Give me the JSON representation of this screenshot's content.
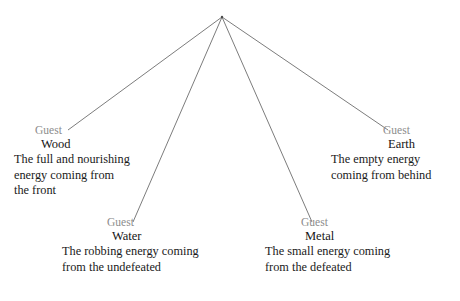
{
  "diagram": {
    "type": "radial-tree",
    "root": {
      "x": 222,
      "y": 17
    },
    "edge_color": "#5a5a5a",
    "guest_color": "#8c8c8c",
    "text_color": "#1a1a1a",
    "nodes": [
      {
        "id": "wood",
        "guest": "Guest",
        "name": "Wood",
        "desc_lines": [
          "The full and nourishing",
          "energy coming from",
          "the front"
        ],
        "edge_end": {
          "x": 68,
          "y": 130
        }
      },
      {
        "id": "water",
        "guest": "Guest",
        "name": "Water",
        "desc_lines": [
          "The robbing energy coming",
          "from the undefeated"
        ],
        "edge_end": {
          "x": 133,
          "y": 222
        }
      },
      {
        "id": "metal",
        "guest": "Guest",
        "name": "Metal",
        "desc_lines": [
          "The small energy coming",
          "from the defeated"
        ],
        "edge_end": {
          "x": 312,
          "y": 222
        }
      },
      {
        "id": "earth",
        "guest": "Guest",
        "name": "Earth",
        "desc_lines": [
          "The empty energy",
          "coming from behind"
        ],
        "edge_end": {
          "x": 388,
          "y": 130
        }
      }
    ]
  }
}
